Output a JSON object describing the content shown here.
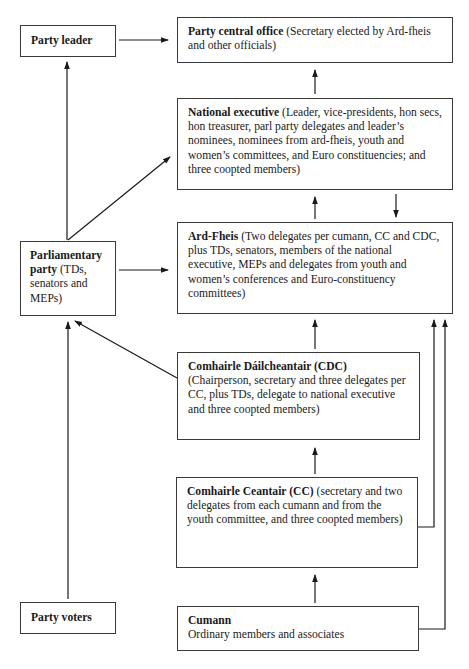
{
  "nodes": {
    "party_leader": {
      "title": "Party leader",
      "desc": ""
    },
    "central_office": {
      "title": "Party central office",
      "desc": " (Secretary elected by Ard-fheis and other officials)"
    },
    "national_executive": {
      "title": "National executive",
      "desc": " (Leader, vice-presidents, hon secs, hon treasurer, parl party delegates and leader’s nominees, nominees from ard-fheis, youth and women’s committees, and Euro constituencies; and three coopted members)"
    },
    "ard_fheis": {
      "title": "Ard-Fheis",
      "desc": " (Two delegates per cumann, CC and CDC, plus TDs, senators, members of the national executive, MEPs and delegates from youth and women’s conferences and Euro-constituency committees)"
    },
    "parliamentary_party": {
      "title": "Parliamentary party",
      "desc": " (TDs, senators and MEPs)"
    },
    "cdc": {
      "title": "Comhairle Dáilcheantair (CDC)",
      "desc": "(Chairperson, secretary and three delegates per CC, plus TDs, delegate to national executive and three coopted members)"
    },
    "cc": {
      "title": "Comhairle Ceantair (CC)",
      "desc": " (secretary and two delegates from each cumann and from the youth committee, and three coopted members)"
    },
    "party_voters": {
      "title": "Party voters",
      "desc": ""
    },
    "cumann": {
      "title": "Cumann",
      "desc": "Ordinary members and associates"
    }
  },
  "edges": [
    [
      "party_leader",
      "central_office"
    ],
    [
      "national_executive",
      "central_office"
    ],
    [
      "parliamentary_party",
      "party_leader"
    ],
    [
      "parliamentary_party",
      "national_executive"
    ],
    [
      "parliamentary_party",
      "ard_fheis"
    ],
    [
      "ard_fheis",
      "national_executive"
    ],
    [
      "national_executive",
      "ard_fheis"
    ],
    [
      "cdc",
      "ard_fheis"
    ],
    [
      "cdc",
      "parliamentary_party"
    ],
    [
      "cc",
      "cdc"
    ],
    [
      "cc",
      "ard_fheis"
    ],
    [
      "cumann",
      "cc"
    ],
    [
      "cumann",
      "ard_fheis"
    ],
    [
      "party_voters",
      "parliamentary_party"
    ]
  ]
}
